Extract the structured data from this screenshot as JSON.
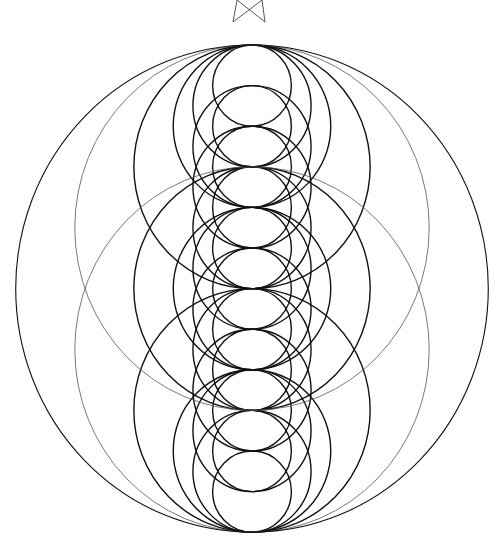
{
  "figure": {
    "type": "coaxial-tangent-circles",
    "stroke_color": "#111111",
    "background": "#ffffff",
    "axis_x": 252,
    "top_y": 45,
    "spacing": 40.6,
    "x_scale": 0.97,
    "tangent_point_count": 13,
    "circles": [
      [
        0,
        2
      ],
      [
        1,
        3
      ],
      [
        2,
        4
      ],
      [
        3,
        5
      ],
      [
        4,
        6
      ],
      [
        5,
        7
      ],
      [
        6,
        8
      ],
      [
        7,
        9
      ],
      [
        8,
        10
      ],
      [
        9,
        11
      ],
      [
        10,
        12
      ],
      [
        0,
        3
      ],
      [
        1,
        4
      ],
      [
        2,
        5
      ],
      [
        3,
        6
      ],
      [
        4,
        7
      ],
      [
        5,
        8
      ],
      [
        6,
        9
      ],
      [
        7,
        10
      ],
      [
        8,
        11
      ],
      [
        9,
        12
      ],
      [
        0,
        4
      ],
      [
        4,
        8
      ],
      [
        8,
        12
      ],
      [
        0,
        6
      ],
      [
        6,
        12
      ],
      [
        3,
        9
      ],
      [
        0,
        9
      ],
      [
        3,
        12
      ],
      [
        0,
        12
      ]
    ],
    "light_circles": [
      [
        0,
        9
      ],
      [
        3,
        12
      ]
    ],
    "top_mark": {
      "name": "bowtie-mark",
      "lines": [
        [
          237,
          0,
          265,
          22
        ],
        [
          262,
          0,
          233,
          22
        ],
        [
          237,
          0,
          233,
          22
        ],
        [
          262,
          0,
          265,
          22
        ]
      ]
    }
  }
}
